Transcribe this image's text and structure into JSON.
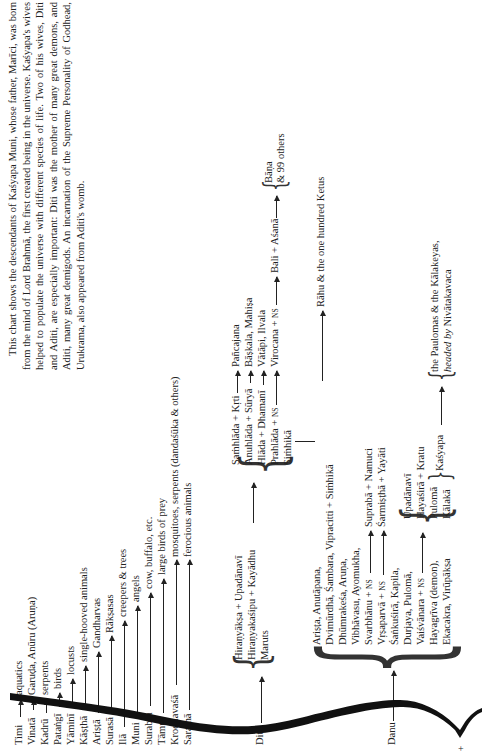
{
  "description": "This chart shows the descendants of Kaśyapa Muni, whose father, Marīci, was born from the mind of Lord Brahmā, the first created being in the universe. Kaśyapa's wives helped to populate the universe with different species of life. Two of his wives, Diti and Aditi, are especially important: Diti was the mother of many great demons, and Aditi, many great demigods. An incarnation of the Supreme Personality of Godhead, Urukrama, also appeared from Aditi's womb.",
  "wives": [
    {
      "name": "Timi",
      "offspring": "aquatics"
    },
    {
      "name": "Vinatā",
      "offspring": "Garuḍa, Anūru (Aruṇa)"
    },
    {
      "name": "Kadrū",
      "offspring": "serpents"
    },
    {
      "name": "Pataṅgī",
      "offspring": "birds"
    },
    {
      "name": "Yāminī",
      "offspring": "locusts"
    },
    {
      "name": "Kāṣṭhā",
      "offspring": "single-hooved animals"
    },
    {
      "name": "Ariṣṭā",
      "offspring": "Gandharvas"
    },
    {
      "name": "Surasā",
      "offspring": "Rākṣasas"
    },
    {
      "name": "Ilā",
      "offspring": "creepers & trees"
    },
    {
      "name": "Muni",
      "offspring": "angels"
    },
    {
      "name": "Surabhi",
      "offspring": "cow, buffalo, etc."
    },
    {
      "name": "Tāmrā",
      "offspring": "large birds of prey"
    },
    {
      "name": "Krodhavaśā",
      "offspring": "mosquitoes, serpents (dandaśūka & others)"
    },
    {
      "name": "Saramā",
      "offspring": "ferocious animals"
    }
  ],
  "diti": {
    "name": "Diti",
    "children": [
      "Hiraṇyākṣa + Upadānavī",
      "Hiraṇyakaśipu + Kayādhu",
      "Maruts"
    ],
    "hiranyakasipu_children": [
      "Saṁhlāda + Kṛti",
      "Anuhlāda + Sūryā",
      "Hlāda + Dhamanī",
      "Prahlāda + NS",
      "Siṁhikā"
    ],
    "grandchildren": [
      "Pañcajana",
      "Bāṣkala, Mahiṣa",
      "Vātāpi, Ilvala",
      "Virocana + NS"
    ],
    "virocana_son": "Bali + Aśanā",
    "bali_children": [
      "Bāṇa",
      "& 99 others"
    ],
    "simhika_union": "Dvimūrdhā, Śambara, Vipracitti + Siṁhikā",
    "simhika_children": "Rāhu & the one hundred Ketus"
  },
  "danu": {
    "name": "Danu",
    "children": [
      "Ariṣṭa, Anutāpana,",
      "Dvimūrdhā, Śambara, Vipracitti + Siṁhikā",
      "Dhūmrakeśa, Aruṇa,",
      "Vibhāvasu, Ayomukha,",
      "Svarbhānu + NS",
      "Vṛṣaparvā + NS",
      "Śaṅkuśirā, Kapila,",
      "Durjaya, Pulomā,",
      "Vaiśvānara + NS",
      "Hayagrīva (demon),",
      "Ekacakra, Virūpākṣa"
    ],
    "svarbhanu_child": "Suprabā + Namuci",
    "vrsaparva_child": "Śarmiṣṭhā + Yayāti",
    "vaisvanara_children": [
      "Upadānavī",
      "Hayaśirā + Kratu",
      "Pulomā",
      "Kālakā"
    ],
    "kasyapa": "Kaśyapa",
    "kasyapa_children_line1": "the Paulomas & the Kālakeyas,",
    "kasyapa_children_line2_italic": "headed by",
    "kasyapa_children_line2": "Nivātakavaca"
  }
}
